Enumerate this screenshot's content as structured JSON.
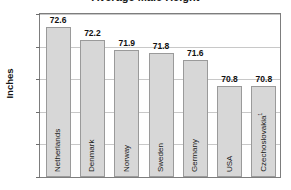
{
  "chart_data": {
    "type": "bar",
    "title": "Average Male Height",
    "xlabel": "",
    "ylabel": "Inches",
    "ylim": [
      68,
      73
    ],
    "yticks": [
      "68",
      "69",
      "70",
      "71",
      "72",
      "73"
    ],
    "grid": true,
    "legend": "none",
    "categories": [
      "Netherlands",
      "Denmark",
      "Norway",
      "Sweden",
      "Germany",
      "USA",
      "Czechoslovakia"
    ],
    "values": [
      72.6,
      72.2,
      71.9,
      71.8,
      71.6,
      70.8,
      70.8
    ],
    "value_labels": [
      "72.6",
      "72.2",
      "71.9",
      "71.8",
      "71.6",
      "70.8",
      "70.8"
    ],
    "footnote_markers": [
      "",
      "",
      "",
      "",
      "",
      "",
      "1"
    ],
    "colors": {
      "bar_fill": "#d7d7d7",
      "bar_border": "#9a9a9a",
      "gridline": "#c8c8c8",
      "frame": "#7d7d7d",
      "text": "#111111"
    }
  }
}
